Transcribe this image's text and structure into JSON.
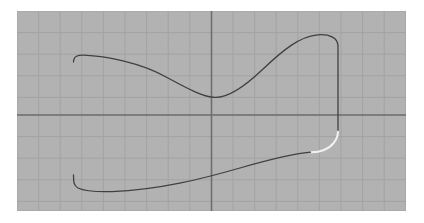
{
  "app": {
    "title": "Curve Editor Canvas",
    "background_color": "#ffffff"
  },
  "canvas": {
    "name": "grid-canvas",
    "x": 17,
    "y": 11,
    "width": 389,
    "height": 200,
    "fill_color": "#b2b2b2",
    "border_color": "#b2b2b2"
  },
  "grid": {
    "minor_spacing": 21.6,
    "minor_color": "#a3a3a3",
    "minor_width": 1,
    "major_color": "#6e6e6e",
    "major_width": 1.6,
    "visible": true,
    "origin_x": 211.5,
    "origin_y": 115.0,
    "vertical_lines": [
      17,
      38.6,
      60.2,
      81.8,
      103.4,
      125,
      146.6,
      168.2,
      189.8,
      211.5,
      233,
      254.6,
      276.2,
      297.8,
      319.4,
      341,
      362.6,
      384.2,
      405.8
    ],
    "horizontal_lines": [
      11,
      32.6,
      54.2,
      75.8,
      97.4,
      115,
      136.6,
      158.2,
      179.8,
      201.4,
      211
    ]
  },
  "axes": {
    "x_axis_label": "",
    "y_axis_label": "",
    "x_axis_y": 115.0,
    "y_axis_x": 211.5,
    "color": "#5f5f5f"
  },
  "shape": {
    "name": "closed-bone-curve",
    "stroke_color": "#404040",
    "stroke_width": 1.3,
    "fill": "none",
    "gap_stroke_color": "#f2f2f2",
    "gap_stroke_width": 2.0,
    "description": "Closed rounded peanut / bone outline spanning the grid with a light-colored break on the lower right",
    "main_path": "M 73.5 62 C 73.5 56 78 55 84 55.2 C 104 56 140 62 168 78 C 190 90 204 97 215 97.4 C 226 97.8 243 88 262 70 C 283 50 300 36 318 34.8 C 330 34 338 38 338 46 L 338 130.5",
    "lower_path": "M 310.5 152.2 C 292 154 268 160 240 168 C 205 178 160 190 112 191.6 C 96 192 84 191 78 188 C 73.5 185.5 73.5 181 73.5 175",
    "gap_path": "M 338 130.8 C 338 140 332 147 324 150 C 319 152 314 152.4 310.8 152.3",
    "left_edge_x": 73.5,
    "right_edge_x": 338,
    "top_plateau_y": 34.8,
    "bottom_plateau_y": 191.6,
    "waist_top_point": [
      215,
      97.4
    ],
    "waist_bottom_point": [
      310.5,
      152.2
    ]
  },
  "nodes": {
    "visible": false,
    "points": []
  },
  "status": {
    "text": "",
    "zoom": ""
  }
}
